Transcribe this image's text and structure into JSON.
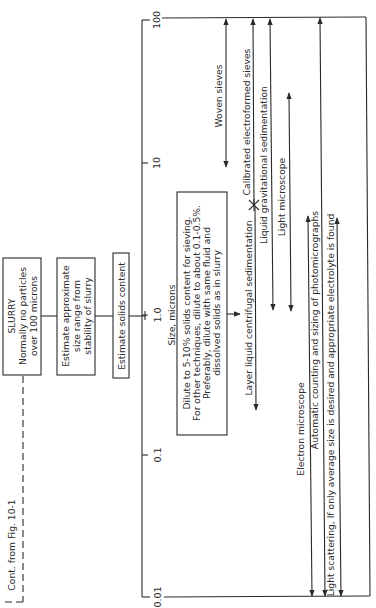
{
  "diagram": {
    "orientation": "rotated 90deg counterclockwise",
    "axis": {
      "label": "Size, microns",
      "ticks": [
        "0.01",
        "0.1",
        "1.0",
        "10",
        "100"
      ]
    },
    "continuation_label": "Cont. from Fig. 10-1",
    "flow_boxes": [
      {
        "id": "slurry",
        "lines": [
          "SLURRY",
          "Normally no particles",
          "over 100 microns"
        ]
      },
      {
        "id": "estimate-size",
        "lines": [
          "Estimate approximate",
          "size range from",
          "stability of slurry"
        ]
      },
      {
        "id": "estimate-solids",
        "lines": [
          "Estimate solids content"
        ]
      },
      {
        "id": "dilute",
        "lines": [
          "Dilute to 5-10% solids content for sieving.",
          "For other techniques, dilute to about 0.1-0.5%.",
          "Preferably, dilute with same fluid and",
          "dissolved solids as in slurry"
        ]
      }
    ],
    "methods": [
      {
        "name": "Woven sieves",
        "range_microns": [
          10,
          100
        ]
      },
      {
        "name": "Calibrated electroformed sieves",
        "range_microns": [
          5,
          100
        ]
      },
      {
        "name": "Liquid gravitational sedimentation",
        "range_microns": [
          1,
          100
        ]
      },
      {
        "name": "Light microscope",
        "range_microns": [
          1,
          50
        ]
      },
      {
        "name": "Layer liquid centrifugal sedimentation",
        "range_microns": [
          0.2,
          5
        ]
      },
      {
        "name": "Electron microscope",
        "range_microns": [
          0.01,
          1
        ]
      },
      {
        "name": "Automatic counting and sizing of photomicrographs",
        "range_microns": [
          0.01,
          100
        ]
      },
      {
        "name": "Light scattering, If only average size is desired and appropriate electrolyte is found",
        "range_microns": [
          0.01,
          1
        ]
      }
    ]
  }
}
